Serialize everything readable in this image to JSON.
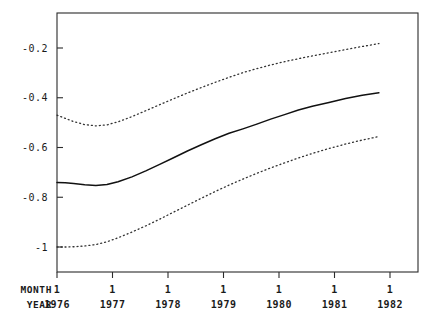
{
  "chart_data": {
    "type": "line",
    "title": "",
    "subtitle": "",
    "xlabel": "",
    "ylabel": "",
    "grid": false,
    "legend": "none",
    "xlim": [
      1976.0,
      1982.0
    ],
    "ylim": [
      -1.12,
      -0.105
    ],
    "y_ticks": [
      "-0.2",
      "-0.4",
      "-0.6",
      "-0.8",
      "-1"
    ],
    "y_tick_values": [
      -0.2,
      -0.4,
      -0.6,
      -0.8,
      -1
    ],
    "x_axis_rows": [
      {
        "row_label": "MONTH",
        "ticks": [
          "1",
          "1",
          "1",
          "1",
          "1",
          "1",
          "1"
        ]
      },
      {
        "row_label": "YEAR",
        "ticks": [
          "1976",
          "1977",
          "1978",
          "1979",
          "1980",
          "1981",
          "1982"
        ]
      }
    ],
    "x_tick_values": [
      1976,
      1977,
      1978,
      1979,
      1980,
      1981,
      1982
    ],
    "x": [
      1976.0,
      1976.15,
      1976.3,
      1976.5,
      1976.7,
      1976.9,
      1977.1,
      1977.35,
      1977.6,
      1977.85,
      1978.1,
      1978.35,
      1978.6,
      1978.85,
      1979.1,
      1979.35,
      1979.6,
      1979.85,
      1980.1,
      1980.35,
      1980.6,
      1980.9,
      1981.2,
      1981.5,
      1981.8
    ],
    "series": [
      {
        "name": "upper-confidence-band",
        "style": "dotted",
        "color": "#333333",
        "values": [
          -0.47,
          -0.483,
          -0.496,
          -0.508,
          -0.513,
          -0.509,
          -0.497,
          -0.476,
          -0.452,
          -0.428,
          -0.404,
          -0.381,
          -0.359,
          -0.338,
          -0.318,
          -0.299,
          -0.283,
          -0.268,
          -0.255,
          -0.243,
          -0.232,
          -0.219,
          -0.206,
          -0.194,
          -0.182
        ]
      },
      {
        "name": "estimate",
        "style": "solid",
        "color": "#111111",
        "values": [
          -0.741,
          -0.742,
          -0.745,
          -0.75,
          -0.753,
          -0.749,
          -0.738,
          -0.718,
          -0.694,
          -0.668,
          -0.641,
          -0.614,
          -0.589,
          -0.565,
          -0.543,
          -0.525,
          -0.506,
          -0.486,
          -0.468,
          -0.449,
          -0.434,
          -0.419,
          -0.403,
          -0.39,
          -0.38
        ]
      },
      {
        "name": "lower-confidence-band",
        "style": "dotted",
        "color": "#333333",
        "values": [
          -1.0,
          -1.0,
          -0.999,
          -0.996,
          -0.99,
          -0.979,
          -0.963,
          -0.94,
          -0.915,
          -0.888,
          -0.86,
          -0.832,
          -0.804,
          -0.777,
          -0.751,
          -0.727,
          -0.704,
          -0.682,
          -0.662,
          -0.642,
          -0.624,
          -0.604,
          -0.586,
          -0.57,
          -0.556
        ]
      }
    ]
  },
  "geometry": {
    "plot_left": 57,
    "plot_right": 418,
    "plot_top": 13,
    "plot_bottom": 272,
    "x_pixel_first_tick": 57,
    "x_pixel_tick_spacing": 55.5,
    "y_pixel_minus02": 48,
    "y_pixel_minus1": 247
  }
}
